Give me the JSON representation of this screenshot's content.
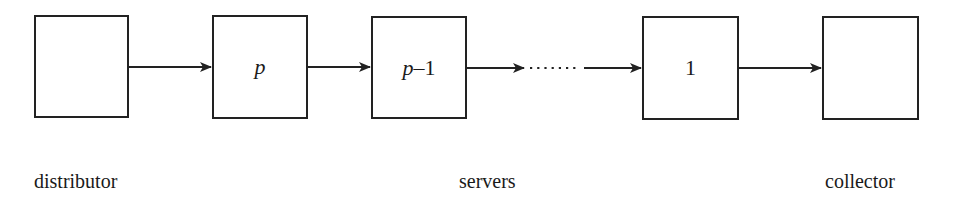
{
  "diagram": {
    "type": "pipeline",
    "nodes": [
      {
        "id": "distributor",
        "label": ""
      },
      {
        "id": "server-p",
        "label_var": "p",
        "label_suffix": ""
      },
      {
        "id": "server-p-1",
        "label_var": "p",
        "label_suffix": "–1"
      },
      {
        "id": "server-1",
        "label": "1"
      },
      {
        "id": "collector",
        "label": ""
      }
    ],
    "edges": [
      {
        "from": "distributor",
        "to": "server-p",
        "style": "solid"
      },
      {
        "from": "server-p",
        "to": "server-p-1",
        "style": "solid"
      },
      {
        "from": "server-p-1",
        "to": "server-1",
        "style": "dotted-elided"
      },
      {
        "from": "server-1",
        "to": "collector",
        "style": "solid"
      }
    ],
    "captions": {
      "distributor": "distributor",
      "servers": "servers",
      "collector": "collector"
    },
    "colors": {
      "stroke": "#222222",
      "background": "#ffffff"
    }
  }
}
